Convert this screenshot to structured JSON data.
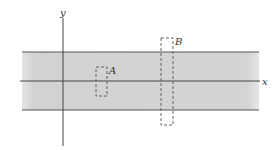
{
  "diagram": {
    "axes": {
      "x_label": "x",
      "y_label": "y"
    },
    "band": {
      "fill": "#d4d4d4",
      "edge_color": "#555555"
    },
    "regions": [
      {
        "id": "A",
        "label": "A"
      },
      {
        "id": "B",
        "label": "B"
      }
    ],
    "colors": {
      "axis": "#444444",
      "dashed": "#555555",
      "background": "#ffffff"
    }
  }
}
